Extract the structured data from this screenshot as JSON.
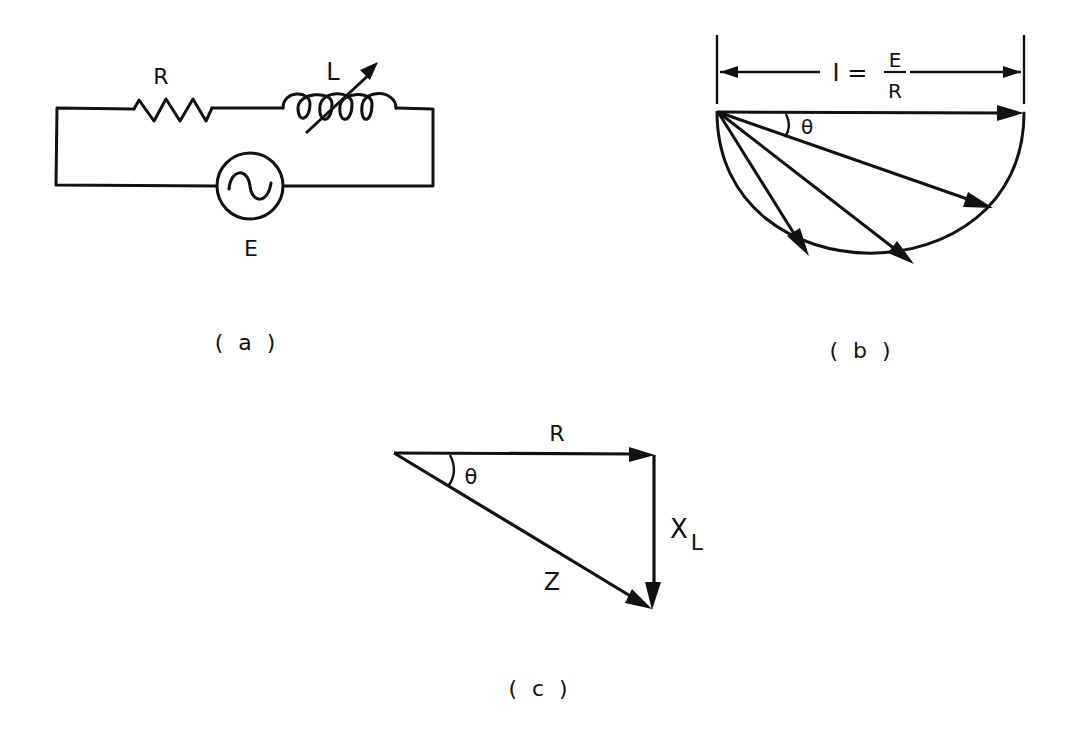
{
  "figure_a": {
    "caption": "( a )",
    "resistor_label": "R",
    "inductor_label": "L",
    "source_label": "E",
    "components": [
      "resistor",
      "variable-inductor",
      "ac-source"
    ]
  },
  "figure_b": {
    "caption": "( b )",
    "dimension_label_left": "I =",
    "fraction_numerator": "E",
    "fraction_denominator": "R",
    "angle_label": "θ",
    "phasor_count": 4
  },
  "figure_c": {
    "caption": "( c )",
    "horizontal_label": "R",
    "vertical_label": "X",
    "vertical_label_subscript": "L",
    "hypotenuse_label": "Z",
    "angle_label": "θ"
  },
  "colors": {
    "ink": "#111111",
    "background": "#ffffff"
  }
}
